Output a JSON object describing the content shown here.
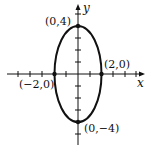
{
  "diagram": {
    "type": "ellipse-graph",
    "equation_shown": false,
    "axes": {
      "x_label": "x",
      "y_label": "y"
    },
    "points": [
      {
        "label": "(0,4)",
        "x": 0,
        "y": 4
      },
      {
        "label": "(2,0)",
        "x": 2,
        "y": 0
      },
      {
        "label": "(-2,0)",
        "display": "(−2,0)",
        "x": -2,
        "y": 0
      },
      {
        "label": "(0,-4)",
        "display": "(0,−4)",
        "x": 0,
        "y": -4
      }
    ],
    "labels": {
      "top": "(0,4)",
      "right": "(2,0)",
      "left": "(−2,0)",
      "bottom": "(0,−4)"
    },
    "colors": {
      "stroke": "#111111",
      "background": "#ffffff"
    }
  }
}
